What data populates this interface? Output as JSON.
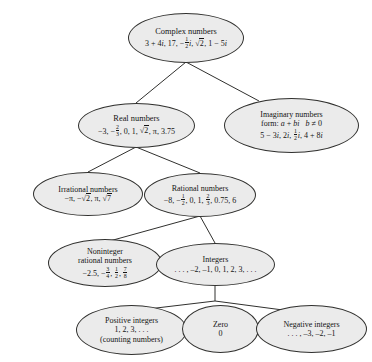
{
  "diagram": {
    "type": "tree",
    "style": {
      "node_fill": "#ebebeb",
      "node_border": "#30302e",
      "edge_color": "#30302e",
      "text_color": "#141414",
      "background": "#ffffff"
    },
    "nodes": [
      {
        "id": "complex",
        "name": "Complex numbers",
        "level": 0,
        "lines": [
          "Complex numbers",
          "3 + 4i, 17, -1/2 i, sqrt(2), 1 - 5i"
        ]
      },
      {
        "id": "real",
        "name": "Real numbers",
        "level": 1,
        "lines": [
          "Real numbers",
          "-3, -2/3, 0, 1, sqrt(2), pi, 3.75"
        ]
      },
      {
        "id": "imaginary",
        "name": "Imaginary numbers",
        "level": 1,
        "lines": [
          "Imaginary numbers",
          "form: a + bi    b != 0",
          "5 - 3i, 2i, 1/2 i, 4 + 8i"
        ]
      },
      {
        "id": "irrational",
        "name": "Irrational numbers",
        "level": 2,
        "lines": [
          "Irrational numbers",
          "-pi, -sqrt(2), pi, sqrt(7)"
        ]
      },
      {
        "id": "rational",
        "name": "Rational numbers",
        "level": 2,
        "lines": [
          "Rational numbers",
          "-8, -1/2, 0, 1, 2/3, 0.75, 6"
        ]
      },
      {
        "id": "noninteger",
        "name": "Noninteger rational numbers",
        "level": 3,
        "lines": [
          "Noninteger",
          "rational numbers",
          "-2.5, -3/4, 1/2, 7/8"
        ]
      },
      {
        "id": "integers",
        "name": "Integers",
        "level": 3,
        "lines": [
          "Integers",
          "..., -2, -1, 0, 1, 2, 3, ..."
        ]
      },
      {
        "id": "positive",
        "name": "Positive integers",
        "level": 4,
        "lines": [
          "Positive integers",
          "1, 2, 3, . . .",
          "(counting numbers)"
        ]
      },
      {
        "id": "zero",
        "name": "Zero",
        "level": 4,
        "lines": [
          "Zero",
          "0"
        ]
      },
      {
        "id": "negative",
        "name": "Negative integers",
        "level": 4,
        "lines": [
          ". . . , -3, -2, -1"
        ]
      }
    ],
    "edges": [
      {
        "from": "complex",
        "to": "real"
      },
      {
        "from": "complex",
        "to": "imaginary"
      },
      {
        "from": "real",
        "to": "irrational"
      },
      {
        "from": "real",
        "to": "rational"
      },
      {
        "from": "rational",
        "to": "noninteger"
      },
      {
        "from": "rational",
        "to": "integers"
      },
      {
        "from": "integers",
        "to": "positive"
      },
      {
        "from": "integers",
        "to": "zero"
      },
      {
        "from": "integers",
        "to": "negative"
      }
    ],
    "labels": {
      "complex_title": "Complex numbers",
      "real_title": "Real numbers",
      "imaginary_title": "Imaginary numbers",
      "imaginary_form_prefix": "form:",
      "irrational_title": "Irrational numbers",
      "rational_title": "Rational numbers",
      "noninteger_title_1": "Noninteger",
      "noninteger_title_2": "rational numbers",
      "integers_title": "Integers",
      "integers_values": ". . . , –2, –1, 0, 1, 2, 3, . . .",
      "positive_title": "Positive integers",
      "positive_values": "1, 2, 3, . . .",
      "positive_note": "(counting numbers)",
      "zero_title": "Zero",
      "zero_value": "0",
      "negative_title": "Negative integers",
      "negative_values": ". . . , –3, –2, –1"
    }
  }
}
